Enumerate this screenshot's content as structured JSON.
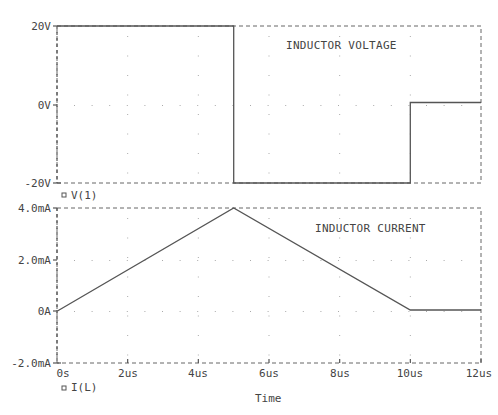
{
  "chart_data": [
    {
      "type": "line",
      "title": "INDUCTOR VOLTAGE",
      "legend": "V(1)",
      "xlabel": "Time",
      "ylabel": "",
      "ylim": [
        -20,
        20
      ],
      "yticks": [
        "20V",
        "0V",
        "-20V"
      ],
      "x_units": "us",
      "y_units": "V",
      "grid": "dotted",
      "series": [
        {
          "name": "V(1)",
          "x": [
            0,
            5,
            5,
            10,
            10,
            12
          ],
          "y": [
            20,
            20,
            -20,
            -20,
            0.5,
            0.5
          ]
        }
      ]
    },
    {
      "type": "line",
      "title": "INDUCTOR CURRENT",
      "legend": "I(L)",
      "xlabel": "Time",
      "ylabel": "",
      "ylim": [
        -2.0,
        4.0
      ],
      "yticks": [
        "4.0mA",
        "2.0mA",
        "0A",
        "-2.0mA"
      ],
      "xticks": [
        "0s",
        "2us",
        "4us",
        "6us",
        "8us",
        "10us",
        "12us"
      ],
      "xlim": [
        0,
        12
      ],
      "x_units": "us",
      "y_units": "mA",
      "grid": "dotted",
      "series": [
        {
          "name": "I(L)",
          "x": [
            0,
            5,
            10,
            12
          ],
          "y": [
            0,
            4.0,
            0.05,
            0.05
          ]
        }
      ]
    }
  ],
  "top_plot": {
    "title": "INDUCTOR VOLTAGE",
    "legend": "V(1)",
    "yticks": [
      "20V",
      "0V",
      "-20V"
    ]
  },
  "bottom_plot": {
    "title": "INDUCTOR CURRENT",
    "legend": "I(L)",
    "yticks": [
      "4.0mA",
      "2.0mA",
      "0A",
      "-2.0mA"
    ]
  },
  "x_axis": {
    "ticks": [
      "0s",
      "2us",
      "4us",
      "6us",
      "8us",
      "10us",
      "12us"
    ],
    "label": "Time"
  }
}
